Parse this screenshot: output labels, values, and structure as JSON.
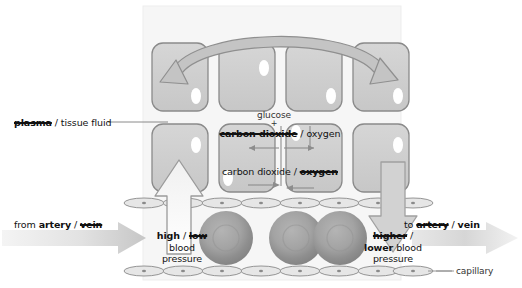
{
  "diagram": {
    "labels": {
      "plasma_struck": "plasma",
      "plasma_sep": " / ",
      "tissue_fluid": "tissue fluid",
      "glucose": "glucose",
      "plus": "+",
      "upper_struck": "carbon dioxide",
      "upper_sep": " / ",
      "upper_plain": "oxygen",
      "lower_plain": "carbon dioxide",
      "lower_sep": " / ",
      "lower_struck": "oxygen",
      "from_prefix": "from ",
      "from_bold": "artery",
      "from_sep": " / ",
      "from_struck": "vein",
      "to_prefix": "to ",
      "to_struck": "artery",
      "to_sep": " / ",
      "to_bold": "vein",
      "left_pressure_bold": "high",
      "left_pressure_sep": " / ",
      "left_pressure_struck": "low",
      "left_pressure_rest_1": "blood",
      "left_pressure_rest_2": "pressure",
      "right_pressure_struck": "higher",
      "right_pressure_sep": " /",
      "right_pressure_bold": "lower",
      "right_pressure_rest_1": " blood",
      "right_pressure_rest_2": "pressure",
      "capillary": "capillary"
    },
    "colors": {
      "cell_fill": "#cfcfcf",
      "cell_stroke": "#8a8a8a",
      "nucleus": "#ffffff",
      "blood_cell": "#9a9a9a",
      "arrow_big": "#c4c4c4",
      "arrow_stroke": "#9a9a9a",
      "flow_arrow_light": "#efefef",
      "flow_arrow_dark": "#c9c9c9",
      "panel_bg": "#f7f7f7",
      "text": "#111111"
    },
    "counts": {
      "top_row_cells": 4,
      "bottom_row_cells": 4,
      "blood_cells": 3
    }
  }
}
